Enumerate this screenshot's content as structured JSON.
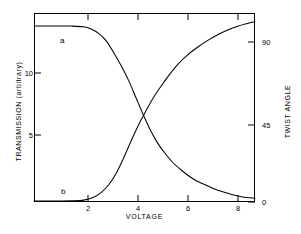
{
  "chart_data": {
    "type": "line",
    "title": "",
    "xlabel": "VOLTAGE",
    "ylabel": "TRANSMISSION (arbitrary)",
    "y2label": "TWIST ANGLE",
    "xlim": [
      0,
      8.9
    ],
    "ylim": [
      0,
      13
    ],
    "y2lim": [
      0,
      100
    ],
    "grid": false,
    "legend": "inline-curve-labels",
    "xticks": [
      2,
      4,
      6,
      8
    ],
    "xticklabels": [
      "2",
      "4",
      "6",
      "8"
    ],
    "yticks": [
      5,
      10
    ],
    "yticklabels": [
      "5",
      "10"
    ],
    "y2ticks": [
      0,
      45,
      90
    ],
    "y2ticklabels": [
      "0",
      "45",
      "90"
    ],
    "annotations": [
      {
        "text": "a",
        "x": 1.05,
        "y_axis": "left",
        "meaning": "transmission curve label"
      },
      {
        "text": "b",
        "x": 1.1,
        "y_axis": "right",
        "meaning": "twist angle curve label"
      }
    ],
    "crossing_point": {
      "x": 4.4,
      "transmission": 6.0,
      "twist_angle": 45
    },
    "series": [
      {
        "name": "a",
        "label": "a",
        "axis": "left",
        "description": "Transmission (arbitrary units) versus voltage — flat plateau then sigmoidal decay",
        "color": "#000000",
        "x": [
          0.0,
          0.5,
          1.0,
          1.5,
          2.0,
          2.3,
          2.6,
          2.9,
          3.2,
          3.5,
          3.8,
          4.1,
          4.4,
          4.7,
          5.0,
          5.3,
          5.6,
          6.0,
          6.4,
          6.8,
          7.2,
          7.6,
          8.0,
          8.4,
          8.9
        ],
        "y": [
          12.1,
          12.1,
          12.1,
          12.1,
          12.05,
          11.9,
          11.6,
          11.1,
          10.3,
          9.4,
          8.4,
          7.2,
          6.0,
          4.9,
          4.0,
          3.3,
          2.7,
          2.1,
          1.6,
          1.25,
          0.95,
          0.7,
          0.5,
          0.35,
          0.25
        ]
      },
      {
        "name": "b",
        "label": "b",
        "axis": "right",
        "description": "Twist angle (degrees) versus voltage — zero plateau then sigmoidal rise toward 90 degrees",
        "color": "#000000",
        "x": [
          0.0,
          0.5,
          1.0,
          1.5,
          2.0,
          2.4,
          2.7,
          3.0,
          3.3,
          3.6,
          3.9,
          4.2,
          4.5,
          4.8,
          5.1,
          5.4,
          5.8,
          6.2,
          6.6,
          7.0,
          7.4,
          7.8,
          8.2,
          8.6,
          8.9
        ],
        "y": [
          0.5,
          0.5,
          0.5,
          0.6,
          1.0,
          2.5,
          5.0,
          9.0,
          15.0,
          23.0,
          32.0,
          40.5,
          48.0,
          55.0,
          61.0,
          66.5,
          73.0,
          78.0,
          82.0,
          85.5,
          88.5,
          91.0,
          93.0,
          94.5,
          95.5
        ]
      }
    ]
  },
  "axes": {
    "x": {
      "label": "VOLTAGE",
      "ticks": [
        {
          "value": 2,
          "label": "2"
        },
        {
          "value": 4,
          "label": "4"
        },
        {
          "value": 6,
          "label": "6"
        },
        {
          "value": 8,
          "label": "8"
        }
      ]
    },
    "y_left": {
      "label": "TRANSMISSION (arbitrary)",
      "ticks": [
        {
          "value": 10,
          "label": "10"
        },
        {
          "value": 5,
          "label": "5"
        }
      ]
    },
    "y_right": {
      "label": "TWIST ANGLE",
      "ticks": [
        {
          "value": 90,
          "label": "90"
        },
        {
          "value": 45,
          "label": "45"
        },
        {
          "value": 0,
          "label": "0"
        }
      ]
    }
  },
  "curve_labels": {
    "a": "a",
    "b": "b"
  }
}
